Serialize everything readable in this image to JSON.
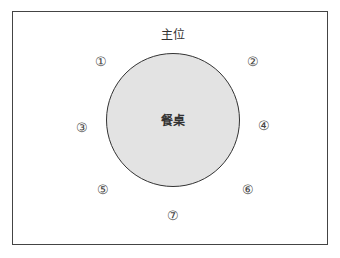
{
  "diagram": {
    "head_seat_label": "主位",
    "table_label": "餐桌",
    "seats": [
      {
        "id": "1",
        "label": "①"
      },
      {
        "id": "2",
        "label": "②"
      },
      {
        "id": "3",
        "label": "③"
      },
      {
        "id": "4",
        "label": "④"
      },
      {
        "id": "5",
        "label": "⑤"
      },
      {
        "id": "6",
        "label": "⑥"
      },
      {
        "id": "7",
        "label": "⑦"
      }
    ],
    "colors": {
      "table_fill": "#e3e3e3",
      "table_border": "#333333",
      "frame_border": "#444444"
    }
  }
}
